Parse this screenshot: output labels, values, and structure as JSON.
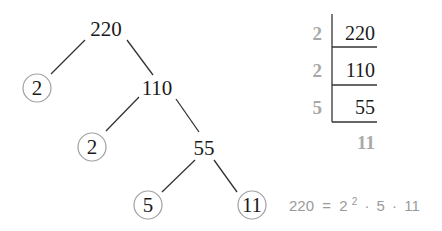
{
  "factor_tree": {
    "root": "220",
    "level1": {
      "prime": "2",
      "composite": "110"
    },
    "level2": {
      "prime": "2",
      "composite": "55"
    },
    "level3": {
      "prime_left": "5",
      "prime_right": "11"
    }
  },
  "division_ladder": {
    "rows": [
      {
        "divisor": "2",
        "dividend": "220"
      },
      {
        "divisor": "2",
        "dividend": "110"
      },
      {
        "divisor": "5",
        "dividend": "55"
      }
    ],
    "quotient": "11"
  },
  "equation": {
    "lhs": "220",
    "equals": "=",
    "base": "2",
    "exponent": "2",
    "dot1": "·",
    "factor2": "5",
    "dot2": "·",
    "factor3": "11"
  },
  "colors": {
    "primary_text": "#1a1a1a",
    "muted_text": "#a8a8a8",
    "circle_stroke": "#a0a0a0",
    "line": "#333333"
  }
}
